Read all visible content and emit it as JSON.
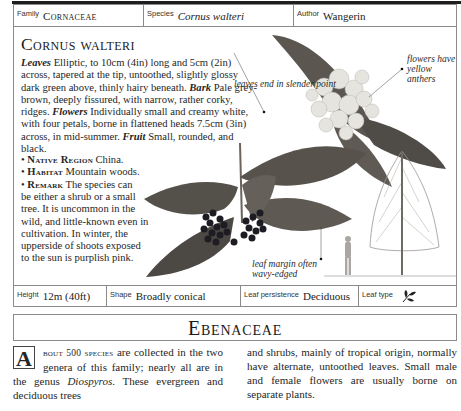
{
  "header": {
    "family_label": "Family",
    "family_value": "Cornaceae",
    "species_label": "Species",
    "species_value": "Cornus walteri",
    "author_label": "Author",
    "author_value": "Wangerin"
  },
  "entry": {
    "title": "Cornus walteri",
    "description": [
      {
        "term": "Leaves",
        "text": " Elliptic, to 10cm (4in) long and 5cm (2in) across, tapered at the tip, untoothed, slightly glossy dark green above, thinly hairy beneath. "
      },
      {
        "term": "Bark",
        "text": " Pale grey-brown, deeply fissured, with narrow, rather corky, ridges. "
      },
      {
        "term": "Flowers",
        "text": " Individually small and creamy white, with four petals, borne in flattened heads 7.5cm (3in) across, in mid-summer. "
      },
      {
        "term": "Fruit",
        "text": " Small, rounded, and black."
      }
    ],
    "bullets": [
      {
        "label": "Native Region",
        "text": " China."
      },
      {
        "label": "Habitat",
        "text": " Mountain woods."
      },
      {
        "label": "Remark",
        "text": " The species can"
      }
    ],
    "remark_continued": "be either a shrub or a small tree. It is uncommon in the wild, and little-known even in cultivation. In winter, the upperside of shoots exposed to the sun is purplish pink."
  },
  "annotations": {
    "leaf_point": "leaves end in slender point",
    "flowers": "flowers have yellow anthers",
    "leaf_margin": "leaf margin often wavy-edged"
  },
  "footer": {
    "height_label": "Height",
    "height_value": "12m (40ft)",
    "shape_label": "Shape",
    "shape_value": "Broadly conical",
    "persistence_label": "Leaf persistence",
    "persistence_value": "Deciduous",
    "leaf_type_label": "Leaf type",
    "leaf_type_icon": "simple-leaf-icon"
  },
  "family_section": {
    "title": "Ebenaceae",
    "dropcap": "A",
    "lead": "bout 500 species",
    "col1_rest": " are collected in the two genera of this family; nearly all are in the genus ",
    "genus": "Diospyros",
    "col1_end": ". These evergreen and deciduous trees",
    "col2": "and shrubs, mainly of tropical origin, normally have alternate, untoothed leaves. Small male and female flowers are usually borne on separate plants."
  },
  "colors": {
    "border": "#8a8a8a",
    "text": "#262626",
    "leaf_dark": "#4a4a44",
    "berry": "#1a1a22"
  }
}
